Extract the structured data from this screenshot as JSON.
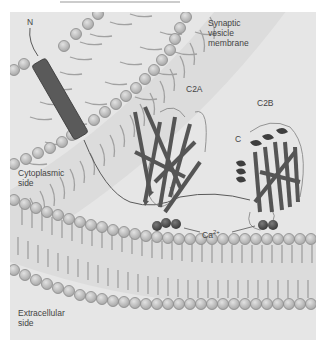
{
  "figure": {
    "labels": {
      "n_terminus": "N",
      "vesicle_membrane": "Synaptic\nvesicle\nmembrane",
      "c2a": "C2A",
      "c2b": "C2B",
      "c_terminus": "C",
      "cytoplasmic": "Cytoplasmic\nside",
      "calcium": "Ca",
      "calcium_sup": "2+",
      "extracellular": "Extracellular\nside"
    },
    "colors": {
      "background": "#e6e6e6",
      "lipid_head": "#c4c4c4",
      "lipid_head_stroke": "#8a8a8a",
      "lipid_tail": "#9a9a9a",
      "transmembrane_helix": "#5a5a5a",
      "protein_strand": "#555555",
      "calcium_ion": "#555555"
    }
  }
}
